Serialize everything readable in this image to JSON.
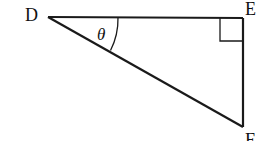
{
  "diagram": {
    "type": "right-triangle",
    "vertices": {
      "D": {
        "label": "D",
        "x": 48,
        "y": 17
      },
      "E": {
        "label": "E",
        "x": 243,
        "y": 18
      },
      "F": {
        "label": "F",
        "x": 243,
        "y": 127
      }
    },
    "angle_label": "θ",
    "angle_at": "D",
    "right_angle_at": "E",
    "stroke_color": "#1a1a1a",
    "background": "#ffffff"
  }
}
